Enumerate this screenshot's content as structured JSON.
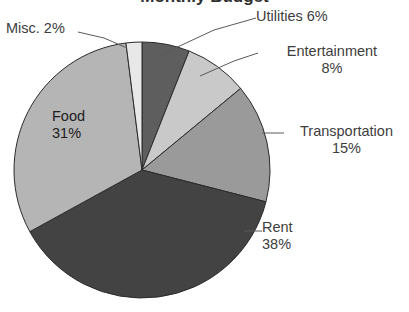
{
  "chart_data": {
    "type": "pie",
    "title": "Monthly Budget",
    "xlabel": "",
    "ylabel": "",
    "legend": "none",
    "grid": false,
    "unit": "%",
    "start_angle_deg": 0,
    "direction": "clockwise",
    "categories": [
      "Utilities",
      "Entertainment",
      "Transportation",
      "Rent",
      "Food",
      "Misc."
    ],
    "values": [
      6,
      8,
      15,
      38,
      31,
      2
    ],
    "slices": [
      {
        "name": "Utilities",
        "label": "Utilities 6%",
        "value": 6,
        "value_text": "6%",
        "color": "#5e5e5e",
        "label_placement": "outside",
        "leader_line": true
      },
      {
        "name": "Entertainment",
        "label": "Entertainment\n8%",
        "value": 8,
        "value_text": "8%",
        "color": "#c9c9c9",
        "label_placement": "outside",
        "leader_line": true
      },
      {
        "name": "Transportation",
        "label": "Transportation\n15%",
        "value": 15,
        "value_text": "15%",
        "color": "#9a9a9a",
        "label_placement": "outside",
        "leader_line": true
      },
      {
        "name": "Rent",
        "label": "Rent\n38%",
        "value": 38,
        "value_text": "38%",
        "color": "#434343",
        "label_placement": "outside",
        "leader_line": true
      },
      {
        "name": "Food",
        "label": "Food\n31%",
        "value": 31,
        "value_text": "31%",
        "color": "#b5b5b5",
        "label_placement": "inside",
        "leader_line": false
      },
      {
        "name": "Misc.",
        "label": "Misc. 2%",
        "value": 2,
        "value_text": "2%",
        "color": "#e8e8e8",
        "label_placement": "outside",
        "leader_line": true
      }
    ],
    "colors": {
      "utilities": "#5e5e5e",
      "entertainment": "#c9c9c9",
      "transportation": "#9a9a9a",
      "rent": "#434343",
      "food": "#b5b5b5",
      "misc": "#e8e8e8",
      "slice_outline": "#2b2b2b",
      "leader_line": "#5a5a5a",
      "background": "#ffffff",
      "text": "#3d3d3d"
    }
  }
}
